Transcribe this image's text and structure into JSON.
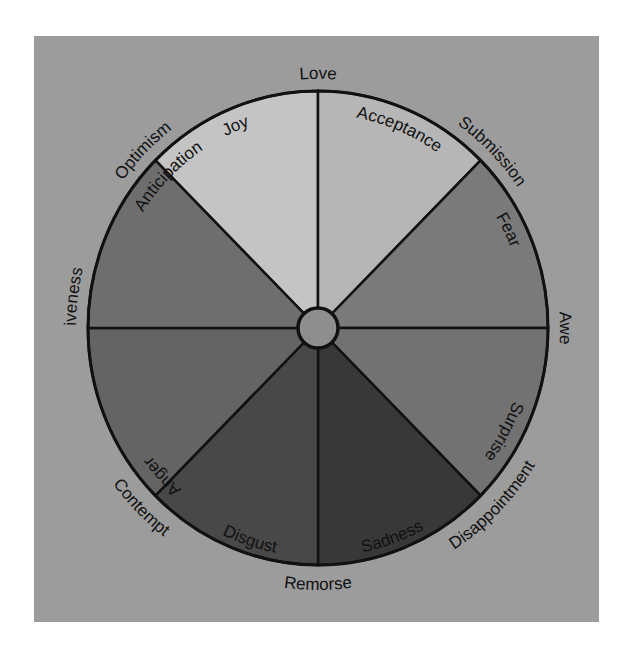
{
  "diagram": {
    "type": "emotion-wheel",
    "center": {
      "x": 318,
      "y": 328,
      "radius_x": 230,
      "radius_y": 237,
      "hub_radius": 20
    },
    "colors": {
      "background_panel": "#9c9c9c",
      "outline": "#111111",
      "hub": "#8e8e8e"
    },
    "primary_emotions": [
      {
        "label": "Joy",
        "color": "#c4c4c4"
      },
      {
        "label": "Acceptance",
        "color": "#b6b6b6"
      },
      {
        "label": "Fear",
        "color": "#7a7a7a"
      },
      {
        "label": "Surprise",
        "color": "#727272"
      },
      {
        "label": "Sadness",
        "color": "#383838"
      },
      {
        "label": "Disgust",
        "color": "#484848"
      },
      {
        "label": "Anger",
        "color": "#646464"
      },
      {
        "label": "Anticipation",
        "color": "#6e6e6e"
      }
    ],
    "dyads": [
      {
        "label": "Love",
        "between": [
          "Joy",
          "Acceptance"
        ]
      },
      {
        "label": "Submission",
        "between": [
          "Acceptance",
          "Fear"
        ]
      },
      {
        "label": "Awe",
        "between": [
          "Fear",
          "Surprise"
        ]
      },
      {
        "label": "Disappointment",
        "between": [
          "Surprise",
          "Sadness"
        ]
      },
      {
        "label": "Remorse",
        "between": [
          "Sadness",
          "Disgust"
        ]
      },
      {
        "label": "Contempt",
        "between": [
          "Disgust",
          "Anger"
        ]
      },
      {
        "label": "Aggressiveness",
        "between": [
          "Anger",
          "Anticipation"
        ]
      },
      {
        "label": "Optimism",
        "between": [
          "Anticipation",
          "Joy"
        ]
      }
    ]
  }
}
